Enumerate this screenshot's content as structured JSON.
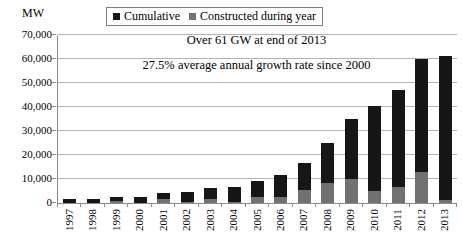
{
  "chart": {
    "y_axis_title": "MW",
    "legend": [
      {
        "label": "Cumulative",
        "color": "#161616"
      },
      {
        "label": "Constructed during year",
        "color": "#717171"
      }
    ],
    "annotations": [
      "Over 61 GW at end of 2013",
      "27.5% average annual growth rate since 2000"
    ]
  },
  "chart_data": {
    "type": "bar",
    "stacked": true,
    "title": "",
    "xlabel": "",
    "ylabel": "MW",
    "ylim": [
      0,
      70000
    ],
    "ytick_step": 10000,
    "grid": "horizontal",
    "legend_position": "top-center",
    "categories": [
      "1997",
      "1998",
      "1999",
      "2000",
      "2001",
      "2002",
      "2003",
      "2004",
      "2005",
      "2006",
      "2007",
      "2008",
      "2009",
      "2010",
      "2011",
      "2012",
      "2013"
    ],
    "series": [
      {
        "name": "Constructed during year",
        "color": "#717171",
        "values": [
          16,
          164,
          663,
          78,
          1697,
          410,
          1687,
          368,
          2409,
          2454,
          5221,
          8252,
          10010,
          5181,
          6652,
          13088,
          1103
        ]
      },
      {
        "name": "Cumulative (total at year end)",
        "color": "#161616",
        "values": [
          1673,
          1837,
          2500,
          2578,
          4275,
          4685,
          6372,
          6740,
          9149,
          11603,
          16824,
          25076,
          35086,
          40267,
          46919,
          60007,
          61110
        ]
      }
    ],
    "annotations": [
      "Over 61 GW at end of 2013",
      "27.5% average annual growth rate since 2000"
    ]
  }
}
